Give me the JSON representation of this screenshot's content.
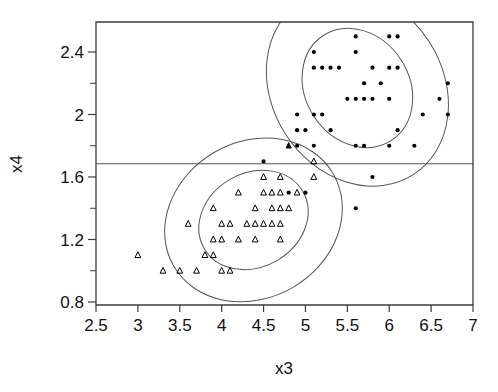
{
  "chart_data": {
    "type": "scatter",
    "title": "",
    "xlabel": "x3",
    "ylabel": "x4",
    "xlim": [
      2.5,
      7.0
    ],
    "ylim": [
      0.8,
      2.55
    ],
    "grid": false,
    "legend": "none",
    "x_ticks": [
      "2.5",
      "3",
      "3.5",
      "4",
      "4.5",
      "5",
      "5.5",
      "6",
      "6.5",
      "7"
    ],
    "x_tick_values": [
      2.5,
      3.0,
      3.5,
      4.0,
      4.5,
      5.0,
      5.5,
      6.0,
      6.5,
      7.0
    ],
    "y_ticks": [
      "0.8",
      "1.2",
      "1.6",
      "2",
      "2.4"
    ],
    "y_tick_values": [
      0.8,
      1.2,
      1.6,
      2.0,
      2.4
    ],
    "y_minor_values": [
      1.0,
      1.4,
      1.8,
      2.2
    ],
    "annotations": [
      {
        "name": "horizontal-reference-line",
        "type": "hline",
        "y": 1.685
      }
    ],
    "ellipses": [
      {
        "name": "group-a-outer-ellipse",
        "cx": 5.62,
        "cy": 2.17,
        "rx": 1.02,
        "ry": 0.66,
        "angle": -33
      },
      {
        "name": "group-a-inner-ellipse",
        "cx": 5.62,
        "cy": 2.17,
        "rx": 0.62,
        "ry": 0.4,
        "angle": -33
      },
      {
        "name": "group-b-outer-ellipse",
        "cx": 4.38,
        "cy": 1.325,
        "rx": 1.1,
        "ry": 0.5,
        "angle": -30
      },
      {
        "name": "group-b-inner-ellipse",
        "cx": 4.38,
        "cy": 1.325,
        "rx": 0.68,
        "ry": 0.3,
        "angle": -30
      }
    ],
    "series": [
      {
        "name": "group-a-dots",
        "marker": "filled-circle",
        "color": "#000000",
        "points": [
          [
            5.6,
            2.5
          ],
          [
            6.0,
            2.5
          ],
          [
            6.1,
            2.5
          ],
          [
            5.1,
            2.4
          ],
          [
            5.6,
            2.4
          ],
          [
            5.1,
            2.3
          ],
          [
            5.2,
            2.3
          ],
          [
            5.3,
            2.3
          ],
          [
            5.4,
            2.3
          ],
          [
            5.8,
            2.3
          ],
          [
            6.0,
            2.3
          ],
          [
            6.1,
            2.3
          ],
          [
            5.7,
            2.2
          ],
          [
            5.9,
            2.2
          ],
          [
            6.7,
            2.2
          ],
          [
            5.5,
            2.1
          ],
          [
            5.6,
            2.1
          ],
          [
            5.7,
            2.1
          ],
          [
            5.8,
            2.1
          ],
          [
            6.0,
            2.1
          ],
          [
            6.6,
            2.1
          ],
          [
            4.9,
            2.0
          ],
          [
            5.1,
            2.0
          ],
          [
            5.2,
            2.0
          ],
          [
            6.4,
            2.0
          ],
          [
            6.7,
            2.0
          ],
          [
            4.9,
            1.9
          ],
          [
            5.0,
            1.9
          ],
          [
            5.3,
            1.9
          ],
          [
            6.1,
            1.9
          ],
          [
            4.9,
            1.8
          ],
          [
            5.1,
            1.8
          ],
          [
            5.6,
            1.8
          ],
          [
            5.7,
            1.8
          ],
          [
            6.0,
            1.8
          ],
          [
            6.3,
            1.8
          ],
          [
            4.5,
            1.7
          ],
          [
            5.8,
            1.6
          ],
          [
            4.8,
            1.5
          ],
          [
            5.0,
            1.5
          ],
          [
            5.6,
            1.4
          ]
        ]
      },
      {
        "name": "group-b-triangles",
        "marker": "open-triangle",
        "color": "#000000",
        "points": [
          [
            5.1,
            1.7
          ],
          [
            4.5,
            1.6
          ],
          [
            4.7,
            1.6
          ],
          [
            5.1,
            1.6
          ],
          [
            4.2,
            1.5
          ],
          [
            4.5,
            1.5
          ],
          [
            4.6,
            1.5
          ],
          [
            4.7,
            1.5
          ],
          [
            4.9,
            1.5
          ],
          [
            3.9,
            1.4
          ],
          [
            4.4,
            1.4
          ],
          [
            4.6,
            1.4
          ],
          [
            4.7,
            1.4
          ],
          [
            4.8,
            1.4
          ],
          [
            3.6,
            1.3
          ],
          [
            4.0,
            1.3
          ],
          [
            4.1,
            1.3
          ],
          [
            4.3,
            1.3
          ],
          [
            4.4,
            1.3
          ],
          [
            4.5,
            1.3
          ],
          [
            4.6,
            1.3
          ],
          [
            4.7,
            1.3
          ],
          [
            3.9,
            1.2
          ],
          [
            4.0,
            1.2
          ],
          [
            4.2,
            1.2
          ],
          [
            4.4,
            1.2
          ],
          [
            4.7,
            1.2
          ],
          [
            3.0,
            1.1
          ],
          [
            3.8,
            1.1
          ],
          [
            3.9,
            1.1
          ],
          [
            3.3,
            1.0
          ],
          [
            3.5,
            1.0
          ],
          [
            3.7,
            1.0
          ],
          [
            4.0,
            1.0
          ],
          [
            4.1,
            1.0
          ]
        ]
      },
      {
        "name": "highlighted-point",
        "marker": "filled-triangle",
        "color": "#000000",
        "points": [
          [
            4.8,
            1.8
          ]
        ]
      }
    ]
  },
  "axes": {
    "x_title": "x3",
    "y_title": "x4"
  }
}
